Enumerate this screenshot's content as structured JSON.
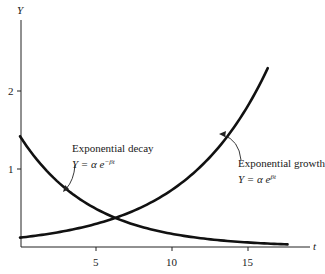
{
  "chart_data": {
    "type": "line",
    "title": "",
    "xlabel": "t",
    "ylabel": "Y",
    "xlim": [
      0,
      19
    ],
    "ylim": [
      0,
      2.9
    ],
    "grid": false,
    "legend": "none",
    "x_ticks": [
      5,
      10,
      15
    ],
    "x_tick_labels": [
      "5",
      "10",
      "15"
    ],
    "y_ticks": [
      1,
      2
    ],
    "y_tick_labels": [
      "1",
      "2"
    ],
    "series": [
      {
        "name": "Exponential decay",
        "equation": "Y = α e^(−βt)",
        "function": "1.42*exp(-0.213*t)",
        "t_range": [
          0,
          17.6
        ],
        "points": [
          [
            0,
            1.42
          ],
          [
            2,
            0.93
          ],
          [
            4,
            0.61
          ],
          [
            5.8,
            0.41
          ],
          [
            8,
            0.26
          ],
          [
            10,
            0.17
          ],
          [
            12,
            0.11
          ],
          [
            15,
            0.06
          ],
          [
            17.6,
            0.03
          ]
        ]
      },
      {
        "name": "Exponential growth",
        "equation": "Y = α e^(βt)",
        "function": "0.12*exp(0.181*t)",
        "t_range": [
          0,
          16.3
        ],
        "points": [
          [
            0,
            0.12
          ],
          [
            2,
            0.17
          ],
          [
            4,
            0.25
          ],
          [
            5.8,
            0.34
          ],
          [
            8,
            0.51
          ],
          [
            10,
            0.73
          ],
          [
            12,
            1.05
          ],
          [
            14,
            1.52
          ],
          [
            16.3,
            2.3
          ]
        ]
      }
    ],
    "annotations": [
      {
        "text": "Exponential decay",
        "formula": "Y = α e^(−βt)",
        "target": "decay curve near t≈3"
      },
      {
        "text": "Exponential growth",
        "formula": "Y = α e^(βt)",
        "target": "growth curve near t≈13"
      }
    ]
  },
  "axes": {
    "x_label": "t",
    "y_label": "Y",
    "x_ticks": [
      "5",
      "10",
      "15"
    ],
    "y_ticks": [
      "1",
      "2"
    ]
  },
  "annotations": {
    "decay": {
      "title": "Exponential decay",
      "formula_prefix": "Y = α e",
      "formula_sup": "−βt"
    },
    "growth": {
      "title": "Exponential growth",
      "formula_prefix": "Y = α e",
      "formula_sup": "βt"
    }
  },
  "style": {
    "line_color": "#111111",
    "axis_color": "#222222"
  }
}
